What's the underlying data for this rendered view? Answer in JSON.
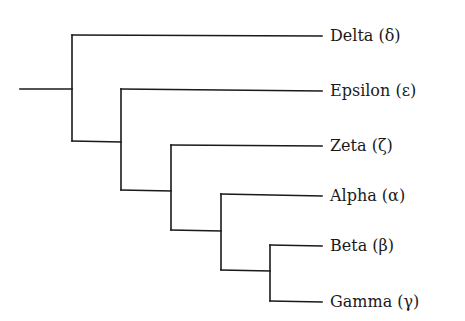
{
  "diagram": {
    "type": "phylogenetic-tree",
    "orientation": "left-to-right",
    "line_color": "#1a1a1a",
    "leaves": [
      {
        "id": "delta",
        "label": "Delta (δ)",
        "y": 36
      },
      {
        "id": "epsilon",
        "label": "Epsilon (ε)",
        "y": 91
      },
      {
        "id": "zeta",
        "label": "Zeta (ζ)",
        "y": 146
      },
      {
        "id": "alpha",
        "label": "Alpha (α)",
        "y": 196
      },
      {
        "id": "beta",
        "label": "Beta (β)",
        "y": 246
      },
      {
        "id": "gamma",
        "label": "Gamma (γ)",
        "y": 302
      }
    ],
    "topology": "(Delta,(Epsilon,(Zeta,(Alpha,(Beta,Gamma)))))"
  }
}
